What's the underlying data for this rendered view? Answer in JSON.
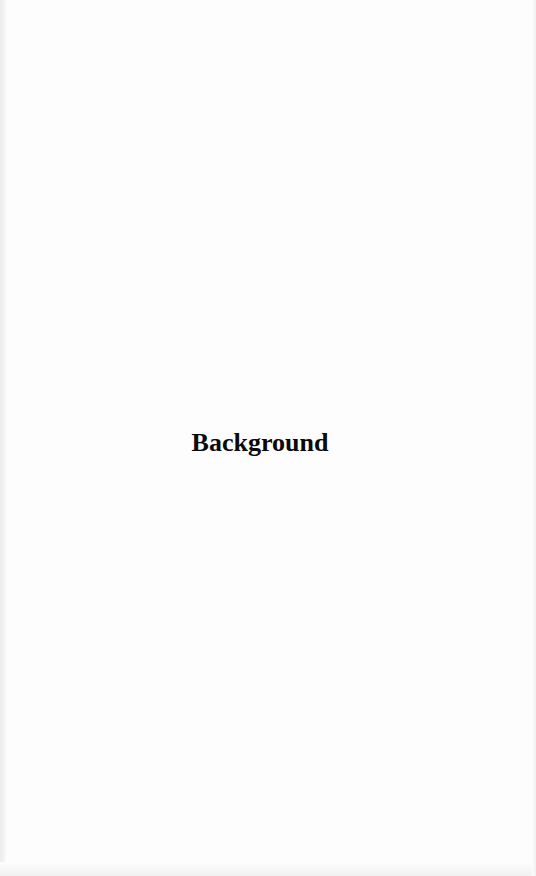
{
  "document": {
    "type": "scanned-page",
    "heading": "Background"
  }
}
